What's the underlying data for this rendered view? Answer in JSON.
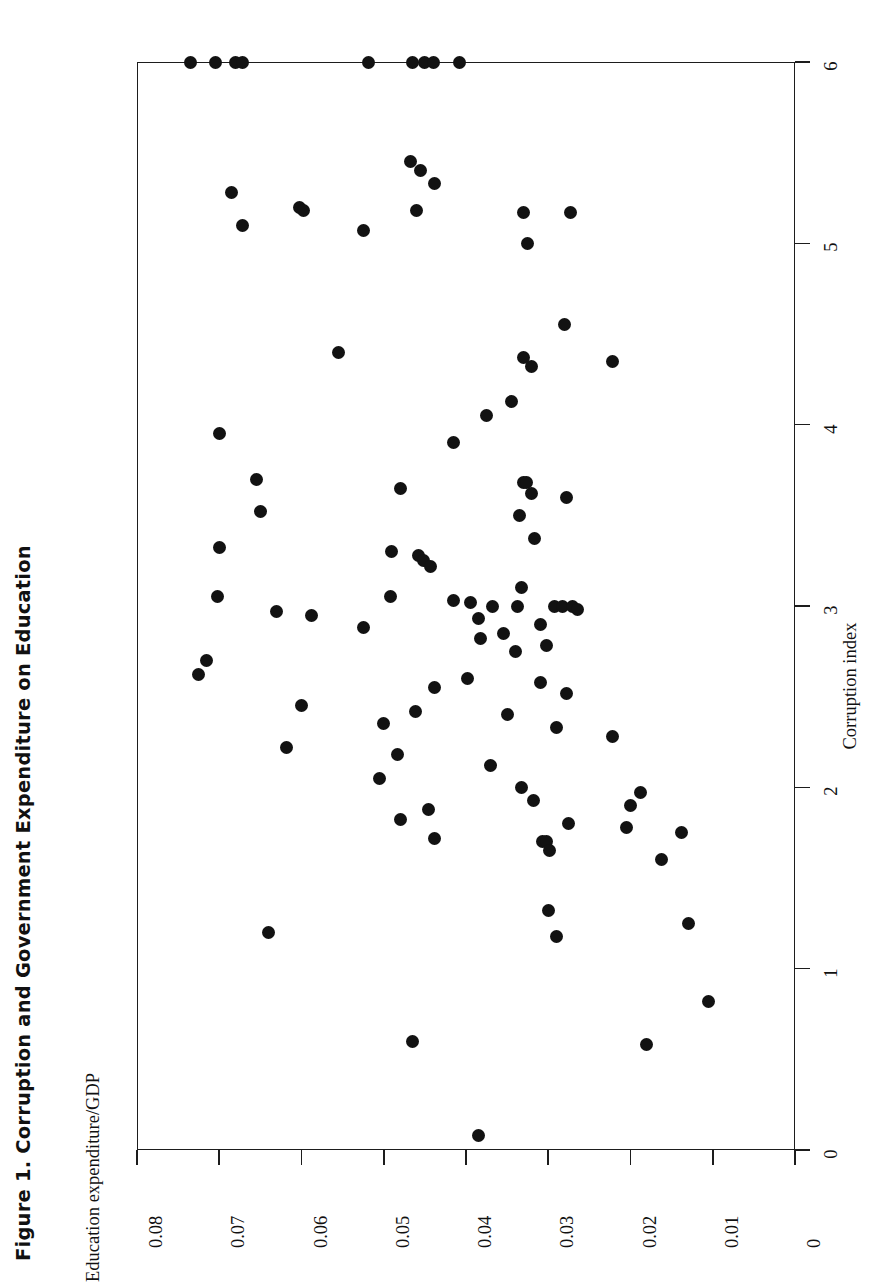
{
  "figure": {
    "title": "Figure 1. Corruption and Government Expenditure on Education",
    "orientation": "rotated-90-ccw"
  },
  "chart_data": {
    "type": "scatter",
    "title": "Figure 1. Corruption and Government Expenditure on Education",
    "xlabel": "Corruption index",
    "ylabel": "Education expenditure/GDP",
    "xlim": [
      0,
      6
    ],
    "ylim": [
      0,
      0.08
    ],
    "grid": false,
    "legend": null,
    "marker": {
      "shape": "circle",
      "color": "#121212",
      "size": 13
    },
    "xticks": [
      0,
      1,
      2,
      3,
      4,
      5,
      6
    ],
    "xticklabels": [
      "0",
      "1",
      "2",
      "3",
      "4",
      "5",
      "6"
    ],
    "yticks": [
      0,
      0.01,
      0.02,
      0.03,
      0.04,
      0.05,
      0.06,
      0.07,
      0.08
    ],
    "yticklabels": [
      "0",
      "0.01",
      "0.02",
      "0.03",
      "0.04",
      "0.05",
      "0.06",
      "0.07",
      "0.08"
    ],
    "n_points": 111,
    "points": [
      {
        "x": 6.0,
        "y": 0.0735
      },
      {
        "x": 6.0,
        "y": 0.0705
      },
      {
        "x": 6.0,
        "y": 0.068
      },
      {
        "x": 6.0,
        "y": 0.0672
      },
      {
        "x": 6.0,
        "y": 0.0518
      },
      {
        "x": 6.0,
        "y": 0.0465
      },
      {
        "x": 6.0,
        "y": 0.045
      },
      {
        "x": 6.0,
        "y": 0.044
      },
      {
        "x": 6.0,
        "y": 0.0408
      },
      {
        "x": 5.45,
        "y": 0.0468
      },
      {
        "x": 5.4,
        "y": 0.0455
      },
      {
        "x": 5.33,
        "y": 0.0438
      },
      {
        "x": 5.28,
        "y": 0.0685
      },
      {
        "x": 5.2,
        "y": 0.0603
      },
      {
        "x": 5.18,
        "y": 0.0597
      },
      {
        "x": 5.18,
        "y": 0.046
      },
      {
        "x": 5.17,
        "y": 0.033
      },
      {
        "x": 5.17,
        "y": 0.0273
      },
      {
        "x": 5.1,
        "y": 0.0672
      },
      {
        "x": 5.07,
        "y": 0.0525
      },
      {
        "x": 5.0,
        "y": 0.0325
      },
      {
        "x": 4.55,
        "y": 0.028
      },
      {
        "x": 4.4,
        "y": 0.0555
      },
      {
        "x": 4.37,
        "y": 0.033
      },
      {
        "x": 4.32,
        "y": 0.032
      },
      {
        "x": 4.35,
        "y": 0.0222
      },
      {
        "x": 4.13,
        "y": 0.0345
      },
      {
        "x": 4.05,
        "y": 0.0375
      },
      {
        "x": 3.95,
        "y": 0.07
      },
      {
        "x": 3.9,
        "y": 0.0415
      },
      {
        "x": 3.7,
        "y": 0.0655
      },
      {
        "x": 3.68,
        "y": 0.033
      },
      {
        "x": 3.68,
        "y": 0.0327
      },
      {
        "x": 3.65,
        "y": 0.048
      },
      {
        "x": 3.62,
        "y": 0.032
      },
      {
        "x": 3.6,
        "y": 0.0278
      },
      {
        "x": 3.52,
        "y": 0.065
      },
      {
        "x": 3.5,
        "y": 0.0335
      },
      {
        "x": 3.37,
        "y": 0.0317
      },
      {
        "x": 3.32,
        "y": 0.07
      },
      {
        "x": 3.3,
        "y": 0.049
      },
      {
        "x": 3.28,
        "y": 0.0458
      },
      {
        "x": 3.25,
        "y": 0.0452
      },
      {
        "x": 3.22,
        "y": 0.0443
      },
      {
        "x": 3.1,
        "y": 0.0332
      },
      {
        "x": 3.05,
        "y": 0.0702
      },
      {
        "x": 3.05,
        "y": 0.0492
      },
      {
        "x": 3.03,
        "y": 0.0415
      },
      {
        "x": 3.02,
        "y": 0.0395
      },
      {
        "x": 3.0,
        "y": 0.0368
      },
      {
        "x": 3.0,
        "y": 0.0338
      },
      {
        "x": 3.0,
        "y": 0.0292
      },
      {
        "x": 3.0,
        "y": 0.0283
      },
      {
        "x": 3.0,
        "y": 0.027
      },
      {
        "x": 2.98,
        "y": 0.0265
      },
      {
        "x": 2.97,
        "y": 0.063
      },
      {
        "x": 2.95,
        "y": 0.0588
      },
      {
        "x": 2.93,
        "y": 0.0385
      },
      {
        "x": 2.9,
        "y": 0.031
      },
      {
        "x": 2.88,
        "y": 0.0525
      },
      {
        "x": 2.85,
        "y": 0.0355
      },
      {
        "x": 2.82,
        "y": 0.0382
      },
      {
        "x": 2.78,
        "y": 0.0302
      },
      {
        "x": 2.75,
        "y": 0.034
      },
      {
        "x": 2.7,
        "y": 0.0715
      },
      {
        "x": 2.62,
        "y": 0.0725
      },
      {
        "x": 2.6,
        "y": 0.0398
      },
      {
        "x": 2.58,
        "y": 0.031
      },
      {
        "x": 2.55,
        "y": 0.0438
      },
      {
        "x": 2.52,
        "y": 0.0278
      },
      {
        "x": 2.45,
        "y": 0.06
      },
      {
        "x": 2.42,
        "y": 0.0462
      },
      {
        "x": 2.4,
        "y": 0.035
      },
      {
        "x": 2.35,
        "y": 0.05
      },
      {
        "x": 2.33,
        "y": 0.029
      },
      {
        "x": 2.28,
        "y": 0.0222
      },
      {
        "x": 2.22,
        "y": 0.0618
      },
      {
        "x": 2.18,
        "y": 0.0483
      },
      {
        "x": 2.12,
        "y": 0.037
      },
      {
        "x": 2.05,
        "y": 0.0505
      },
      {
        "x": 2.0,
        "y": 0.0333
      },
      {
        "x": 1.97,
        "y": 0.0188
      },
      {
        "x": 1.93,
        "y": 0.0318
      },
      {
        "x": 1.9,
        "y": 0.02
      },
      {
        "x": 1.88,
        "y": 0.0445
      },
      {
        "x": 1.82,
        "y": 0.048
      },
      {
        "x": 1.8,
        "y": 0.0275
      },
      {
        "x": 1.78,
        "y": 0.0205
      },
      {
        "x": 1.75,
        "y": 0.0138
      },
      {
        "x": 1.72,
        "y": 0.0438
      },
      {
        "x": 1.7,
        "y": 0.0307
      },
      {
        "x": 1.7,
        "y": 0.0302
      },
      {
        "x": 1.65,
        "y": 0.0298
      },
      {
        "x": 1.6,
        "y": 0.0162
      },
      {
        "x": 1.32,
        "y": 0.03
      },
      {
        "x": 1.25,
        "y": 0.013
      },
      {
        "x": 1.2,
        "y": 0.064
      },
      {
        "x": 1.18,
        "y": 0.029
      },
      {
        "x": 0.82,
        "y": 0.0105
      },
      {
        "x": 0.6,
        "y": 0.0465
      },
      {
        "x": 0.58,
        "y": 0.018
      },
      {
        "x": 0.08,
        "y": 0.0385
      }
    ]
  },
  "axes": {
    "y_axis": {
      "label": "Education expenditure/GDP",
      "ticks": [
        "0.08",
        "0.07",
        "0.06",
        "0.05",
        "0.04",
        "0.03",
        "0.02",
        "0.01",
        "0"
      ]
    },
    "x_axis": {
      "label": "Corruption index",
      "ticks": [
        "0",
        "1",
        "2",
        "3",
        "4",
        "5",
        "6"
      ]
    }
  },
  "colors": {
    "marker": "#121212",
    "axis": "#1d1d1d",
    "background": "#ffffff"
  }
}
